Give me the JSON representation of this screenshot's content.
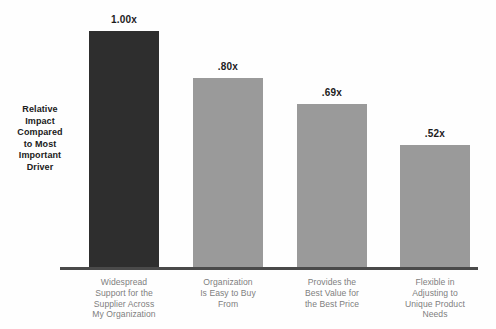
{
  "chart_data": {
    "type": "bar",
    "title": "",
    "subtitle": "",
    "xlabel": "",
    "ylabel": "Relative Impact Compared to Most Important Driver",
    "ylabel_lines": [
      "Relative",
      "Impact",
      "Compared",
      "to Most",
      "Important",
      "Driver"
    ],
    "ylim": [
      0,
      1.0
    ],
    "grid": false,
    "legend": "none",
    "categories": [
      "Widespread Support for the Supplier Across My Organization",
      "Organization Is Easy to Buy From",
      "Provides the Best Value for the Best Price",
      "Flexible in Adjusting to Unique Product Needs"
    ],
    "category_lines": [
      [
        "Widespread",
        "Support for the",
        "Supplier Across",
        "My Organization"
      ],
      [
        "Organization",
        "Is Easy to Buy",
        "From"
      ],
      [
        "Provides the",
        "Best Value for",
        "the Best Price"
      ],
      [
        "Flexible in",
        "Adjusting to",
        "Unique Product",
        "Needs"
      ]
    ],
    "values": [
      1.0,
      0.8,
      0.69,
      0.52
    ],
    "value_labels": [
      "1.00x",
      ".80x",
      ".69x",
      ".52x"
    ],
    "bar_colors": [
      "#2e2e2e",
      "#9a9a9a",
      "#9a9a9a",
      "#9a9a9a"
    ]
  },
  "colors": {
    "background": "#fefefe",
    "highlight_bar": "#2e2e2e",
    "default_bar": "#9a9a9a",
    "axis_line": "#4a4a4a",
    "value_text": "#1c1c1c",
    "category_text": "#7e7e7e",
    "axis_caption_text": "#202020"
  }
}
